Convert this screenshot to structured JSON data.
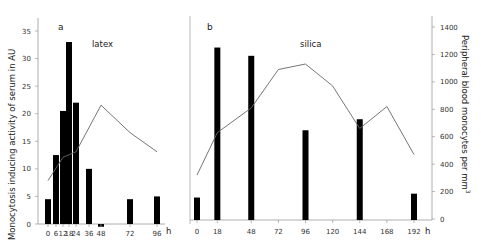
{
  "chart_data": [
    {
      "panel": "a",
      "title": "latex",
      "type": "bar+line",
      "xlabel": "h",
      "ylabel_left": "Monocytosis inducing activity of serum in AU",
      "ylabel_right": "Peripheral blood monocytes per mm3",
      "ylim_left": [
        0,
        35
      ],
      "ylim_right": [
        0,
        1400
      ],
      "yticks_left": [
        0,
        5,
        10,
        15,
        20,
        25,
        30,
        35
      ],
      "yticks_right": [
        0,
        200,
        400,
        600,
        800,
        1000,
        1200,
        1400
      ],
      "x_ticks": [
        "0",
        "6",
        "12",
        "18",
        "24",
        "36",
        "48",
        "72",
        "96"
      ],
      "bars": {
        "name": "Monocytosis inducing activity (AU)",
        "x": [
          0,
          6,
          12,
          18,
          24,
          36,
          48,
          72,
          96
        ],
        "values": [
          4.5,
          12.5,
          20.5,
          33,
          22,
          10,
          -0.5,
          4.5,
          5
        ]
      },
      "line": {
        "name": "Peripheral blood monocytes per mm3",
        "x": [
          0,
          12,
          24,
          48,
          72,
          96
        ],
        "values": [
          280,
          450,
          490,
          830,
          630,
          490
        ]
      }
    },
    {
      "panel": "b",
      "title": "silica",
      "type": "bar+line",
      "xlabel": "h",
      "ylim_left": [
        0,
        35
      ],
      "ylim_right": [
        0,
        1400
      ],
      "x_ticks": [
        "0",
        "18",
        "48",
        "72",
        "96",
        "120",
        "144",
        "168",
        "192"
      ],
      "bars": {
        "name": "Monocytosis inducing activity (AU)",
        "x": [
          0,
          18,
          48,
          96,
          144,
          192
        ],
        "values": [
          4.8,
          32,
          30.5,
          17,
          19,
          5.5
        ]
      },
      "line": {
        "name": "Peripheral blood monocytes per mm3",
        "x": [
          0,
          18,
          48,
          72,
          96,
          120,
          144,
          168,
          192
        ],
        "values": [
          320,
          630,
          810,
          1090,
          1130,
          970,
          660,
          820,
          470
        ]
      }
    }
  ],
  "labels": {
    "panel_a": "a",
    "panel_b": "b",
    "latex": "latex",
    "silica": "silica",
    "h": "h",
    "ylabel_left": "Monocytosis inducing activity of serum in AU",
    "ylabel_right": "Peripheral blood monocytes per mm",
    "ylabel_right_sup": "3"
  }
}
